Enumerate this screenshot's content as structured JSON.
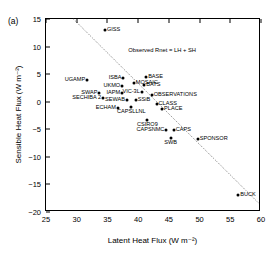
{
  "figure": {
    "panel_label": "(a)",
    "annotation": "Observed Rnet = LH + SH"
  },
  "chart_data": {
    "type": "scatter",
    "title": "",
    "xlabel": "Latent Heat Flux (W m⁻²)",
    "ylabel": "Sensible Heat Flux (W m⁻²)",
    "xlim": [
      25,
      60
    ],
    "ylim": [
      -20,
      15
    ],
    "xticks": [
      25,
      30,
      35,
      40,
      45,
      50,
      55,
      60
    ],
    "yticks": [
      15,
      10,
      5,
      0,
      -5,
      -10,
      -15,
      -20
    ],
    "grid": false,
    "legend": null,
    "annotations": [
      {
        "text": "Observed Rnet = LH + SH",
        "x": 38.4,
        "y": 10.0
      }
    ],
    "reference_line": {
      "name": "Observed Rnet = LH + SH",
      "style": "dotted",
      "x0": 29.5,
      "y0": 15.0,
      "x1": 60.0,
      "y1": -18.8
    },
    "points": [
      {
        "label": "GISS",
        "x": 34.6,
        "y": 13.0,
        "lpos": "r"
      },
      {
        "label": "UGAMP",
        "x": 31.7,
        "y": 4.0,
        "lpos": "l"
      },
      {
        "label": "ISBA",
        "x": 37.6,
        "y": 4.3,
        "lpos": "l"
      },
      {
        "label": "BASE",
        "x": 41.3,
        "y": 4.5,
        "lpos": "r"
      },
      {
        "label": "MOSAIC",
        "x": 39.3,
        "y": 3.4,
        "lpos": "r"
      },
      {
        "label": "BATS",
        "x": 41.0,
        "y": 3.1,
        "lpos": "r"
      },
      {
        "label": "UKMO",
        "x": 37.4,
        "y": 2.9,
        "lpos": "l"
      },
      {
        "label": "SWAP",
        "x": 33.7,
        "y": 1.6,
        "lpos": "l"
      },
      {
        "label": "IAPM",
        "x": 37.4,
        "y": 1.6,
        "lpos": "l"
      },
      {
        "label": "VIC-3L",
        "x": 40.6,
        "y": 1.7,
        "lpos": "l"
      },
      {
        "label": "OBSERVATIONS",
        "x": 42.2,
        "y": 1.3,
        "lpos": "r"
      },
      {
        "label": "SECHIBA 2",
        "x": 34.3,
        "y": 0.6,
        "lpos": "l"
      },
      {
        "label": "SEWAB",
        "x": 38.2,
        "y": 0.4,
        "lpos": "l"
      },
      {
        "label": "SSiB",
        "x": 39.6,
        "y": 0.3,
        "lpos": "r"
      },
      {
        "label": "CLASS",
        "x": 43.0,
        "y": -0.4,
        "lpos": "r"
      },
      {
        "label": "PLACE",
        "x": 43.9,
        "y": -1.3,
        "lpos": "r"
      },
      {
        "label": "ECHAM",
        "x": 36.7,
        "y": -1.1,
        "lpos": "l"
      },
      {
        "label": "CAPSLLNL",
        "x": 38.9,
        "y": -1.0,
        "lpos": "b"
      },
      {
        "label": "CSIRO9",
        "x": 41.5,
        "y": -3.3,
        "lpos": "b"
      },
      {
        "label": "CAPSNMC",
        "x": 44.6,
        "y": -5.1,
        "lpos": "l"
      },
      {
        "label": "CAPS",
        "x": 45.8,
        "y": -5.1,
        "lpos": "r"
      },
      {
        "label": "SWB",
        "x": 45.3,
        "y": -6.5,
        "lpos": "b"
      },
      {
        "label": "SPONSOR",
        "x": 49.7,
        "y": -6.8,
        "lpos": "r"
      },
      {
        "label": "BUCK",
        "x": 56.3,
        "y": -17.0,
        "lpos": "r"
      }
    ]
  }
}
